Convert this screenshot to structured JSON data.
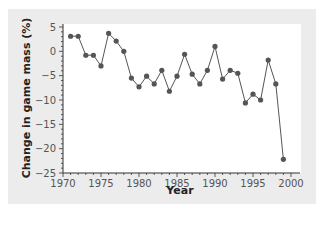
{
  "chart_data": {
    "type": "line",
    "title": "",
    "xlabel": "Year",
    "ylabel": "Change in game mass (%)",
    "xlim": [
      1970,
      2000
    ],
    "ylim": [
      -25,
      5
    ],
    "x_ticks": [
      1970,
      1975,
      1980,
      1985,
      1990,
      1995,
      2000
    ],
    "y_ticks": [
      5,
      0,
      -5,
      -10,
      -15,
      -20,
      -25
    ],
    "x_tick_labels": [
      "1970",
      "1975",
      "1980",
      "1985",
      "1990",
      "1995",
      "2000"
    ],
    "y_tick_labels": [
      "5",
      "0",
      "−5",
      "−10",
      "−15",
      "−20",
      "−25"
    ],
    "grid": false,
    "legend": null,
    "markers": true,
    "series": [
      {
        "name": "Change in game mass",
        "x": [
          1971,
          1972,
          1973,
          1974,
          1975,
          1976,
          1977,
          1978,
          1979,
          1980,
          1981,
          1982,
          1983,
          1984,
          1985,
          1986,
          1987,
          1988,
          1989,
          1990,
          1991,
          1992,
          1993,
          1994,
          1995,
          1996,
          1997,
          1998,
          1999
        ],
        "values": [
          3.1,
          3.1,
          -0.8,
          -0.8,
          -3.0,
          3.7,
          2.1,
          0.0,
          -5.5,
          -7.3,
          -5.1,
          -6.7,
          -3.9,
          -8.2,
          -5.1,
          -0.6,
          -4.7,
          -6.7,
          -3.9,
          1.0,
          -5.7,
          -3.9,
          -4.5,
          -10.6,
          -8.8,
          -10.0,
          -1.8,
          -6.7,
          -22.2
        ]
      }
    ],
    "colors": {
      "line": "#555555",
      "marker": "#555555",
      "panel": "#ececec",
      "plot_area": "#ffffff",
      "axis": "#333333"
    }
  },
  "axes": {
    "xlabel": "Year",
    "ylabel": "Change in game mass (%)"
  }
}
